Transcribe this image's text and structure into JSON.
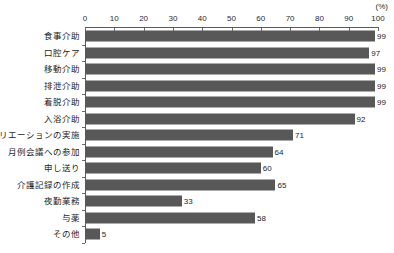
{
  "chart_data": {
    "type": "bar",
    "orientation": "horizontal",
    "title": "",
    "xlabel": "",
    "ylabel": "",
    "unit_label": "(%)",
    "xlim": [
      0,
      100
    ],
    "xticks": [
      0,
      10,
      20,
      30,
      40,
      50,
      60,
      70,
      80,
      90,
      100
    ],
    "xtick_labels": [
      "0",
      "10",
      "20",
      "30",
      "40",
      "50",
      "60",
      "70",
      "80",
      "90",
      "100"
    ],
    "grid": false,
    "legend": null,
    "bar_color": "#585858",
    "axis_color": "#5a5a5a",
    "categories": [
      "食事介助",
      "口腔ケア",
      "移動介助",
      "排泄介助",
      "着脱介助",
      "入浴介助",
      "レクリエーションの実施",
      "月例会議への参加",
      "申し送り",
      "介護記録の作成",
      "夜勤業務",
      "与薬",
      "その他"
    ],
    "values": [
      99,
      97,
      99,
      99,
      99,
      92,
      71,
      64,
      60,
      65,
      33,
      58,
      5
    ],
    "value_labels": [
      "99",
      "97",
      "99",
      "99",
      "99",
      "92",
      "71",
      "64",
      "60",
      "65",
      "33",
      "58",
      "5"
    ]
  }
}
